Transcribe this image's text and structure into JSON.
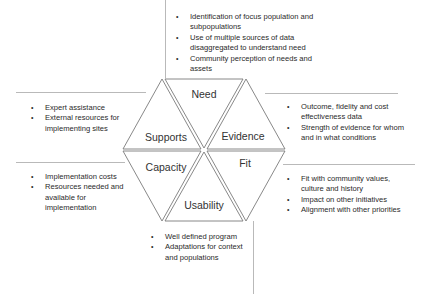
{
  "diagram": {
    "type": "hexagon-framework",
    "segments": [
      {
        "id": "need",
        "label": "Need"
      },
      {
        "id": "evidence",
        "label": "Evidence"
      },
      {
        "id": "fit",
        "label": "Fit"
      },
      {
        "id": "usability",
        "label": "Usability"
      },
      {
        "id": "capacity",
        "label": "Capacity"
      },
      {
        "id": "supports",
        "label": "Supports"
      }
    ],
    "notes": {
      "need": [
        "Identification of focus population and subpopulations",
        "Use of multiple sources of data disaggregated to understand need",
        "Community perception of needs and assets"
      ],
      "evidence": [
        "Outcome, fidelity and cost effectiveness data",
        "Strength of evidence for whom and in what conditions"
      ],
      "fit": [
        "Fit with community values, culture and history",
        "Impact on other initiatives",
        "Alignment with other priorities"
      ],
      "usability": [
        "Well defined program",
        "Adaptations for context and populations"
      ],
      "capacity": [
        "Implementation costs",
        "Resources needed and available for implementation"
      ],
      "supports": [
        "Expert assistance",
        "External resources for implementing sites"
      ]
    },
    "colors": {
      "line": "#7a7a7a",
      "divider": "#b9b9b9",
      "text": "#2a2a2a"
    }
  }
}
